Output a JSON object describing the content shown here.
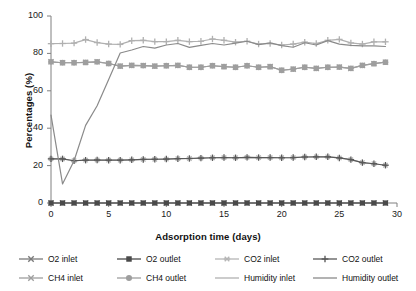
{
  "chart_data": {
    "type": "line",
    "title": "",
    "xlabel": "Adsorption time (days)",
    "ylabel": "Percentages (%)",
    "xlim": [
      0,
      30
    ],
    "ylim": [
      0,
      100
    ],
    "xticks": [
      0,
      5,
      10,
      15,
      20,
      25,
      30
    ],
    "yticks": [
      0,
      20,
      40,
      60,
      80,
      100
    ],
    "grid": false,
    "legend_position": "bottom",
    "x": [
      0,
      1,
      2,
      3,
      4,
      5,
      6,
      7,
      8,
      9,
      10,
      11,
      12,
      13,
      14,
      15,
      16,
      17,
      18,
      19,
      20,
      21,
      22,
      23,
      24,
      25,
      26,
      27,
      28,
      29
    ],
    "series": [
      {
        "name": "O2 inlet",
        "color": "#7a7a7a",
        "marker": "cross",
        "values": [
          0,
          0,
          0,
          0,
          0,
          0,
          0,
          0,
          0,
          0,
          0,
          0,
          0,
          0,
          0,
          0,
          0,
          0,
          0,
          0,
          0,
          0,
          0,
          0,
          0,
          0,
          0,
          0,
          0,
          0
        ]
      },
      {
        "name": "O2 outlet",
        "color": "#4a4a4a",
        "marker": "square",
        "values": [
          0,
          0,
          0,
          0,
          0,
          0,
          0,
          0,
          0,
          0,
          0,
          0,
          0,
          0,
          0,
          0,
          0,
          0,
          0,
          0,
          0,
          0,
          0,
          0,
          0,
          0,
          0,
          0,
          0,
          0
        ]
      },
      {
        "name": "CO2 inlet",
        "color": "#b5b5b5",
        "marker": "star",
        "values": [
          23.6,
          23.6,
          22.6,
          22.9,
          23.0,
          22.9,
          22.9,
          23.1,
          23.3,
          23.4,
          23.5,
          23.7,
          23.8,
          24.0,
          24.2,
          24.3,
          24.2,
          24.4,
          24.3,
          24.3,
          24.2,
          24.3,
          24.6,
          24.7,
          24.7,
          24.1,
          23.2,
          21.6,
          21.0,
          20.2
        ]
      },
      {
        "name": "CO2 outlet",
        "color": "#595959",
        "marker": "plus",
        "values": [
          23.6,
          23.6,
          22.6,
          22.9,
          23.0,
          22.9,
          22.9,
          23.1,
          23.3,
          23.4,
          23.5,
          23.7,
          23.8,
          24.0,
          24.2,
          24.3,
          24.2,
          24.4,
          24.3,
          24.3,
          24.2,
          24.3,
          24.6,
          24.7,
          24.7,
          24.1,
          23.2,
          21.6,
          21.0,
          20.2
        ]
      },
      {
        "name": "CH4 inlet",
        "color": "#9e9e9e",
        "marker": "cross",
        "values": [
          75.5,
          75.0,
          75.0,
          75.2,
          75.5,
          74.6,
          73.2,
          73.6,
          73.5,
          73.2,
          73.4,
          73.6,
          72.6,
          72.6,
          73.4,
          72.9,
          72.6,
          73.4,
          72.6,
          72.9,
          71.0,
          71.6,
          72.6,
          72.0,
          72.6,
          72.7,
          72.0,
          73.6,
          74.5,
          75.3
        ]
      },
      {
        "name": "CH4 outlet",
        "color": "#9e9e9e",
        "marker": "circle",
        "values": [
          75.5,
          75.0,
          75.0,
          75.2,
          75.5,
          74.6,
          73.2,
          73.6,
          73.5,
          73.2,
          73.4,
          73.6,
          72.6,
          72.6,
          73.4,
          72.9,
          72.6,
          73.4,
          72.6,
          72.9,
          71.0,
          71.6,
          72.6,
          72.0,
          72.6,
          72.7,
          72.0,
          73.6,
          74.5,
          75.3
        ]
      },
      {
        "name": "Humidity inlet",
        "color": "#b0b0b0",
        "marker": "plus",
        "values": [
          85.2,
          85.3,
          85.5,
          87.4,
          85.8,
          85.0,
          84.8,
          86.8,
          87.0,
          86.3,
          86.3,
          87.0,
          86.3,
          86.5,
          87.7,
          87.0,
          86.0,
          86.5,
          85.0,
          85.3,
          84.5,
          85.0,
          86.0,
          85.3,
          87.0,
          87.5,
          85.6,
          85.0,
          86.2,
          86.2
        ]
      },
      {
        "name": "Humidity outlet",
        "color": "#8a8a8a",
        "marker": "none",
        "values": [
          47.0,
          10.2,
          22.6,
          41.5,
          52.0,
          66.0,
          80.2,
          81.8,
          83.7,
          82.8,
          84.5,
          85.3,
          83.2,
          84.3,
          85.3,
          84.5,
          85.5,
          86.5,
          84.7,
          85.6,
          84.2,
          83.3,
          85.7,
          84.5,
          86.8,
          85.0,
          84.3,
          84.0,
          84.0,
          83.7
        ]
      }
    ]
  },
  "axes": {
    "x_title": "Adsorption time (days)",
    "y_title": "Percentages (%)",
    "x_ticks": [
      "0",
      "5",
      "10",
      "15",
      "20",
      "25",
      "30"
    ],
    "y_ticks": [
      "0",
      "20",
      "40",
      "60",
      "80",
      "100"
    ]
  },
  "legend": {
    "items": [
      {
        "label": "O2 inlet",
        "color": "#7a7a7a",
        "marker": "cross"
      },
      {
        "label": "O2 outlet",
        "color": "#4a4a4a",
        "marker": "square"
      },
      {
        "label": "CO2 inlet",
        "color": "#b5b5b5",
        "marker": "star"
      },
      {
        "label": "CO2 outlet",
        "color": "#595959",
        "marker": "plus"
      },
      {
        "label": "CH4 inlet",
        "color": "#9e9e9e",
        "marker": "cross"
      },
      {
        "label": "CH4 outlet",
        "color": "#9e9e9e",
        "marker": "circle"
      },
      {
        "label": "Humidity inlet",
        "color": "#b0b0b0",
        "marker": "none"
      },
      {
        "label": "Humidity outlet",
        "color": "#8a8a8a",
        "marker": "none"
      }
    ]
  }
}
